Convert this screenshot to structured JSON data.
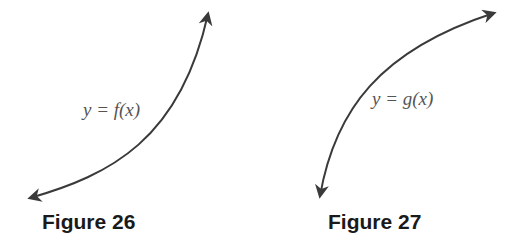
{
  "figures": [
    {
      "caption": "Figure 26",
      "label": "y = f(x)",
      "curve": "increasing, concave up, arrows at both ends"
    },
    {
      "caption": "Figure 27",
      "label": "y = g(x)",
      "curve": "increasing, concave down, arrows at both ends"
    }
  ],
  "colors": {
    "curve": "#3a3a3a",
    "label": "#555555",
    "caption": "#1a1a1a"
  }
}
